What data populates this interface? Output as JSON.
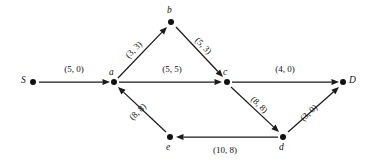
{
  "figure": {
    "type": "network-flow-diagram",
    "label_format": "(capacity, flow)"
  },
  "nodes": [
    {
      "id": "S",
      "label": "S",
      "x": 33,
      "y": 82,
      "label_x": 21,
      "label_y": 76
    },
    {
      "id": "a",
      "label": "a",
      "x": 114,
      "y": 82,
      "label_x": 109,
      "label_y": 68
    },
    {
      "id": "b",
      "label": "b",
      "x": 171,
      "y": 22,
      "label_x": 167,
      "label_y": 6
    },
    {
      "id": "c",
      "label": "c",
      "x": 227,
      "y": 82,
      "label_x": 223,
      "label_y": 68
    },
    {
      "id": "d",
      "label": "d",
      "x": 283,
      "y": 137,
      "label_x": 279,
      "label_y": 143
    },
    {
      "id": "e",
      "label": "e",
      "x": 170,
      "y": 137,
      "label_x": 166,
      "label_y": 143
    },
    {
      "id": "D",
      "label": "D",
      "x": 343,
      "y": 82,
      "label_x": 349,
      "label_y": 76
    }
  ],
  "edges": [
    {
      "id": "S-a",
      "from": "S",
      "to": "a",
      "label": "(5, 0)",
      "capacity": 5,
      "flow": 0,
      "x1": 39,
      "y1": 82,
      "x2": 110,
      "y2": 82,
      "label_x": 74,
      "label_y": 69,
      "label_rotate": 0
    },
    {
      "id": "a-b",
      "from": "a",
      "to": "b",
      "label": "(3, 3)",
      "capacity": 3,
      "flow": 3,
      "x1": 118,
      "y1": 78,
      "x2": 167,
      "y2": 27,
      "label_x": 134,
      "label_y": 50,
      "label_rotate": -46
    },
    {
      "id": "b-c",
      "from": "b",
      "to": "c",
      "label": "(5, 3)",
      "capacity": 5,
      "flow": 3,
      "x1": 176,
      "y1": 27,
      "x2": 223,
      "y2": 77,
      "label_x": 203,
      "label_y": 46,
      "label_rotate": 46
    },
    {
      "id": "a-c",
      "from": "a",
      "to": "c",
      "label": "(5, 5)",
      "capacity": 5,
      "flow": 5,
      "x1": 119,
      "y1": 82,
      "x2": 222,
      "y2": 82,
      "label_x": 172,
      "label_y": 69,
      "label_rotate": 0
    },
    {
      "id": "c-D",
      "from": "c",
      "to": "D",
      "label": "(4, 0)",
      "capacity": 4,
      "flow": 0,
      "x1": 232,
      "y1": 82,
      "x2": 339,
      "y2": 82,
      "label_x": 285,
      "label_y": 69,
      "label_rotate": 0
    },
    {
      "id": "c-d",
      "from": "c",
      "to": "d",
      "label": "(8, 8)",
      "capacity": 8,
      "flow": 8,
      "x1": 231,
      "y1": 87,
      "x2": 279,
      "y2": 132,
      "label_x": 259,
      "label_y": 105,
      "label_rotate": 44
    },
    {
      "id": "d-D",
      "from": "d",
      "to": "D",
      "label": "(3, 0)",
      "capacity": 3,
      "flow": 0,
      "x1": 288,
      "y1": 132,
      "x2": 339,
      "y2": 87,
      "label_x": 309,
      "label_y": 113,
      "label_rotate": -42
    },
    {
      "id": "d-e",
      "from": "d",
      "to": "e",
      "label": "(10, 8)",
      "capacity": 10,
      "flow": 8,
      "x1": 278,
      "y1": 137,
      "x2": 176,
      "y2": 137,
      "label_x": 225,
      "label_y": 150,
      "label_rotate": 0
    },
    {
      "id": "e-a",
      "from": "e",
      "to": "a",
      "label": "(8, 8)",
      "capacity": 8,
      "flow": 8,
      "x1": 166,
      "y1": 132,
      "x2": 118,
      "y2": 87,
      "label_x": 138,
      "label_y": 112,
      "label_rotate": -44
    }
  ]
}
